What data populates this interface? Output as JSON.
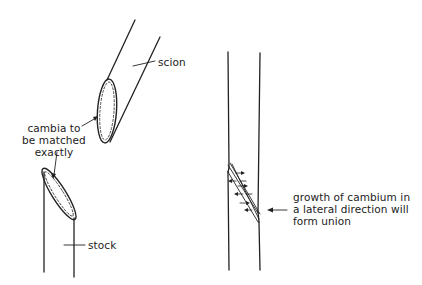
{
  "diagram": {
    "left_panel": {
      "scion_label": "scion",
      "cambia_label": [
        "cambia to",
        "be matched",
        "exactly"
      ],
      "stock_label": "stock"
    },
    "right_panel": {
      "union_label": [
        "growth of cambium in",
        "a lateral direction will",
        "form union"
      ]
    }
  },
  "colors": {
    "ink": "#222222",
    "background": "#ffffff"
  }
}
